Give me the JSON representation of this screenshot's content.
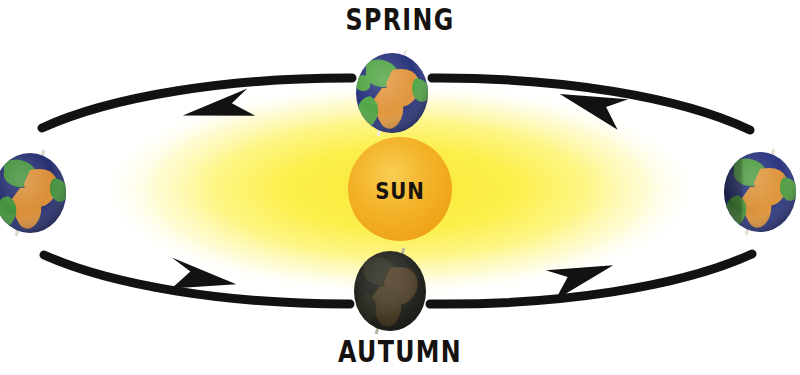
{
  "diagram": {
    "background_color": "#ffffff",
    "labels": {
      "spring": "SPRING",
      "autumn": "AUTUMN",
      "sun": "SUN"
    }
  },
  "sun": {
    "label": "SUN",
    "center_x": 400,
    "center_y": 189,
    "radius": 52,
    "core_color": "#F2A81E",
    "core_highlight": "#F8CC4A",
    "glow_color": "#FAF03A",
    "glow_outer_color": "#FFFFFF",
    "glow_rx": 300,
    "glow_ry": 108
  },
  "orbit": {
    "center_x": 400,
    "center_y": 190,
    "rx": 368,
    "ry": 112,
    "stroke_color": "#121212",
    "stroke_width": 9,
    "direction": "counterclockwise",
    "arrow_color": "#121212",
    "arrows": [
      {
        "name": "top-left-arrow",
        "direction": "left",
        "x": 212,
        "y": 104
      },
      {
        "name": "top-right-arrow",
        "direction": "left",
        "x": 590,
        "y": 103
      },
      {
        "name": "bottom-left-arrow",
        "direction": "right",
        "x": 205,
        "y": 272
      },
      {
        "name": "bottom-right-arrow",
        "direction": "right",
        "x": 580,
        "y": 272
      }
    ]
  },
  "earths": [
    {
      "name": "earth-spring",
      "position": "top",
      "season": "SPRING",
      "center_x": 392,
      "center_y": 93,
      "rx": 36,
      "ry": 40,
      "axis_tilt_deg": 20,
      "lit": true,
      "shade": "none",
      "ocean_color": "#26317A",
      "land_green": "#4FA342",
      "land_tan": "#E0943A",
      "axis_color": "#E8E4D8"
    },
    {
      "name": "earth-autumn",
      "position": "bottom",
      "season": "AUTUMN",
      "center_x": 390,
      "center_y": 291,
      "rx": 36,
      "ry": 40,
      "axis_tilt_deg": 20,
      "lit": false,
      "shade": "full",
      "ocean_color": "#2B2C26",
      "land_green": "#3A3A2E",
      "land_tan": "#5A4A33",
      "axis_color": "#B9B49E"
    },
    {
      "name": "earth-left",
      "position": "left",
      "season": "",
      "center_x": 30,
      "center_y": 193,
      "rx": 36,
      "ry": 40,
      "axis_tilt_deg": 20,
      "lit": true,
      "shade": "none",
      "ocean_color": "#222C6E",
      "land_green": "#3F8F38",
      "land_tan": "#D98C33",
      "axis_color": "#DEDACB"
    },
    {
      "name": "earth-right",
      "position": "right",
      "season": "",
      "center_x": 760,
      "center_y": 192,
      "rx": 36,
      "ry": 40,
      "axis_tilt_deg": 20,
      "lit": true,
      "shade": "left-half",
      "ocean_color": "#27327D",
      "land_green": "#4B9C3E",
      "land_tan": "#DE9338",
      "axis_color": "#E3DFD0"
    }
  ]
}
